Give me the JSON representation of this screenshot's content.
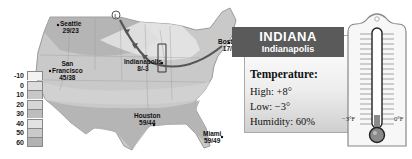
{
  "legend": {
    "items": [
      {
        "label": "-10",
        "color": "#f3f3f3"
      },
      {
        "label": "0",
        "color": "#dcdcdc"
      },
      {
        "label": "10",
        "color": "#c7c7c7"
      },
      {
        "label": "20",
        "color": "#d6d6d6"
      },
      {
        "label": "30",
        "color": "#bdbdbd"
      },
      {
        "label": "40",
        "color": "#e2e2e2"
      },
      {
        "label": "50",
        "color": "#cacaca"
      },
      {
        "label": "60",
        "color": "#b2b2b2"
      }
    ]
  },
  "cities": [
    {
      "name": "Seattle",
      "temps": "29/23"
    },
    {
      "name": "San Francisco",
      "name_line1": "San",
      "name_line2": "Francisco",
      "temps": "45/38"
    },
    {
      "name": "Indianapolis",
      "temps": "8/-3"
    },
    {
      "name": "Boston",
      "temps": "17/8"
    },
    {
      "name": "Houston",
      "temps": "59/44"
    },
    {
      "name": "Miami",
      "temps": "59/49"
    }
  ],
  "front_marker": "L",
  "panel": {
    "state": "INDIANA",
    "capital": "Indianapolis",
    "heading": "Temperature:",
    "high": "High: +8°",
    "low": "Low: −3°",
    "humidity": "Humidity: 60%"
  },
  "thermometer": {
    "left_label": "−3°F",
    "right_label": "0°F",
    "fill_color": "#8a8a8a"
  }
}
